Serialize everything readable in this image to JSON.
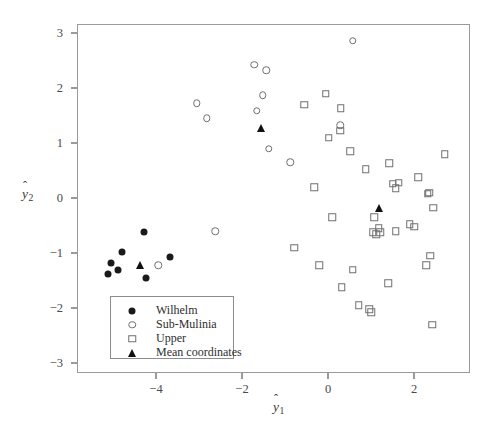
{
  "chart_data": {
    "type": "scatter",
    "title": "",
    "xlabel": "ŷ1",
    "ylabel": "ŷ2",
    "xlabel_base": "y",
    "xlabel_sub": "1",
    "ylabel_base": "y",
    "ylabel_sub": "2",
    "hat": "ˆ",
    "xlim": [
      -5.6,
      3.5
    ],
    "ylim": [
      -3.4,
      3.35
    ],
    "xticks": [
      -4,
      -2,
      0,
      2
    ],
    "xticklabels": [
      "−4",
      "−2",
      "0",
      "2"
    ],
    "yticks": [
      3,
      2,
      1,
      0,
      -1,
      -2,
      -3
    ],
    "yticklabels": [
      "3",
      "2",
      "1",
      "0",
      "−1",
      "−2",
      "−3"
    ],
    "grid": false,
    "legend_position": "lower-left-inside",
    "series": [
      {
        "name": "Wilhelm",
        "marker": "circle-filled",
        "color": "#1a1a1a",
        "points": [
          [
            -5.05,
            -1.18
          ],
          [
            -5.12,
            -1.38
          ],
          [
            -4.78,
            -0.98
          ],
          [
            -4.88,
            -1.3
          ],
          [
            -4.27,
            -0.62
          ],
          [
            -4.23,
            -1.45
          ],
          [
            -3.68,
            -1.08
          ]
        ]
      },
      {
        "name": "Sub-Mulinia",
        "marker": "circle-open",
        "color": "#6f6f6f",
        "points": [
          [
            -3.95,
            -1.22
          ],
          [
            -3.05,
            1.72
          ],
          [
            -2.82,
            1.45
          ],
          [
            -2.62,
            -0.6
          ],
          [
            -1.72,
            2.42
          ],
          [
            -1.44,
            2.32
          ],
          [
            -1.52,
            1.87
          ],
          [
            -1.66,
            1.59
          ],
          [
            -1.38,
            0.9
          ],
          [
            -0.88,
            0.65
          ],
          [
            0.58,
            2.86
          ],
          [
            0.28,
            1.32
          ]
        ]
      },
      {
        "name": "Upper",
        "marker": "square-open",
        "color": "#6f6f6f",
        "points": [
          [
            -0.55,
            1.7
          ],
          [
            -0.05,
            1.9
          ],
          [
            0.3,
            1.63
          ],
          [
            0.28,
            1.22
          ],
          [
            0.02,
            1.1
          ],
          [
            0.52,
            0.85
          ],
          [
            -0.32,
            0.2
          ],
          [
            -0.78,
            -0.9
          ],
          [
            0.1,
            -0.35
          ],
          [
            0.88,
            0.52
          ],
          [
            1.42,
            0.63
          ],
          [
            1.58,
            0.18
          ],
          [
            1.5,
            0.26
          ],
          [
            1.64,
            0.28
          ],
          [
            2.1,
            0.38
          ],
          [
            2.32,
            0.08
          ],
          [
            2.36,
            0.1
          ],
          [
            2.72,
            0.8
          ],
          [
            2.45,
            -0.18
          ],
          [
            1.08,
            -0.35
          ],
          [
            1.18,
            -0.55
          ],
          [
            1.04,
            -0.62
          ],
          [
            1.12,
            -0.66
          ],
          [
            1.22,
            -0.62
          ],
          [
            1.58,
            -0.6
          ],
          [
            1.9,
            -0.48
          ],
          [
            2.0,
            -0.52
          ],
          [
            2.38,
            -1.05
          ],
          [
            2.28,
            -1.22
          ],
          [
            0.58,
            -1.3
          ],
          [
            0.32,
            -1.62
          ],
          [
            1.4,
            -1.55
          ],
          [
            0.72,
            -1.95
          ],
          [
            0.96,
            -2.02
          ],
          [
            1.0,
            -2.08
          ],
          [
            2.42,
            -2.3
          ],
          [
            -0.2,
            -1.22
          ]
        ]
      },
      {
        "name": "Mean coordinates",
        "marker": "triangle-filled",
        "color": "#111111",
        "points": [
          [
            -4.38,
            -1.22
          ],
          [
            -1.55,
            1.28
          ],
          [
            1.18,
            -0.18
          ]
        ]
      }
    ]
  },
  "legend": {
    "items": [
      {
        "label": "Wilhelm",
        "marker": "circle-filled"
      },
      {
        "label": "Sub-Mulinia",
        "marker": "circle-open"
      },
      {
        "label": "Upper",
        "marker": "square-open"
      },
      {
        "label": "Mean coordinates",
        "marker": "triangle-filled"
      }
    ]
  }
}
